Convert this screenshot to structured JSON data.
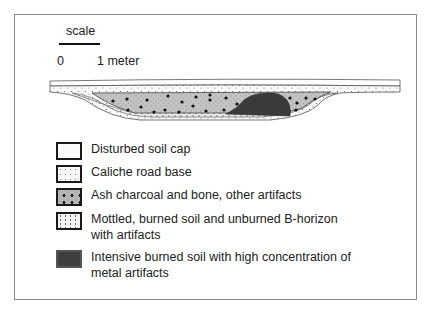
{
  "scale": {
    "label": "scale",
    "start": "0",
    "end": "1 meter"
  },
  "cross_section": {
    "layers": [
      "Disturbed soil cap",
      "Caliche road base",
      "Ash charcoal and bone, other artifacts",
      "Mottled, burned soil and unburned B-horizon with artifacts",
      "Intensive burned soil with high concentration of metal artifacts"
    ]
  },
  "legend": {
    "items": [
      {
        "label": "Disturbed soil cap",
        "pattern": "blank"
      },
      {
        "label": "Caliche road base",
        "pattern": "light-stipple"
      },
      {
        "label": "Ash charcoal and bone, other artifacts",
        "pattern": "gray-with-dots"
      },
      {
        "label": "Mottled, burned soil and unburned B-horizon with artifacts",
        "pattern": "stipple"
      },
      {
        "label": "Intensive burned soil with high concentration of metal artifacts",
        "pattern": "dark-fill"
      }
    ]
  },
  "colors": {
    "frame": "#8a8a8a",
    "ash": "#c6c6c6",
    "burned": "#3a3a3a",
    "outline": "#1a1a1a"
  }
}
